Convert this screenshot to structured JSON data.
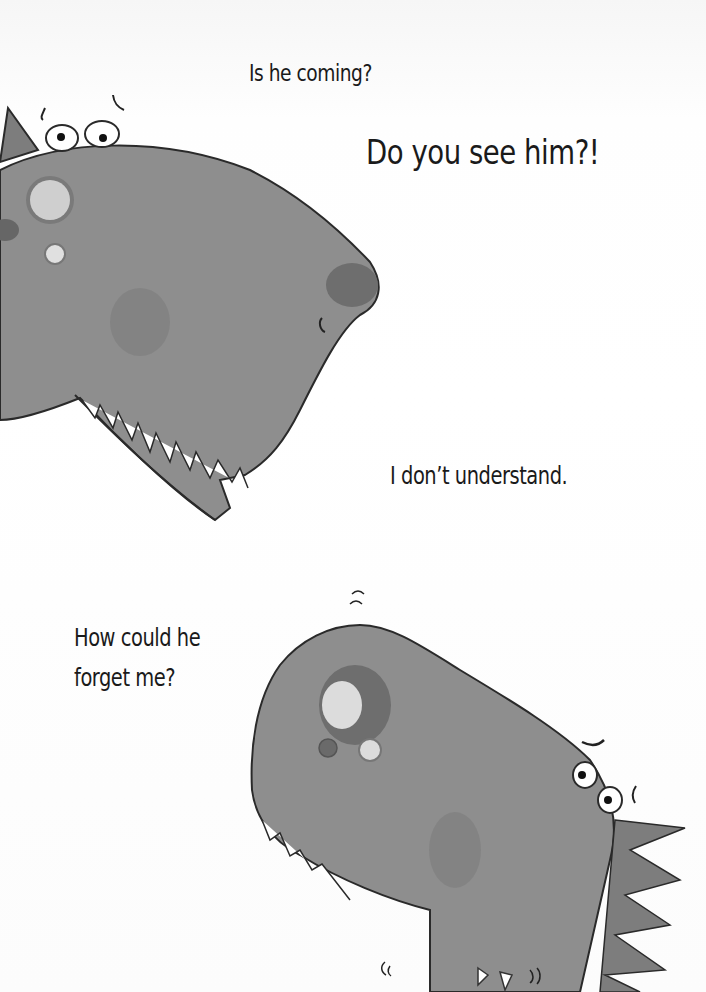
{
  "captions": [
    {
      "id": "cap1",
      "text": "Is he coming?"
    },
    {
      "id": "cap2",
      "text": "Do you see him?!"
    },
    {
      "id": "cap3",
      "text": "I don’t understand."
    },
    {
      "id": "cap4",
      "text": "How could he\nforget me?"
    }
  ],
  "illustration": {
    "characters": [
      "dinosaur-top-left",
      "dinosaur-bottom-right",
      "small-dinosaur-peeking"
    ],
    "colors": {
      "body": "#8e8e8e",
      "outline": "#2a2a2a",
      "spot": "#7a7a7a",
      "teeth": "#ffffff"
    }
  }
}
